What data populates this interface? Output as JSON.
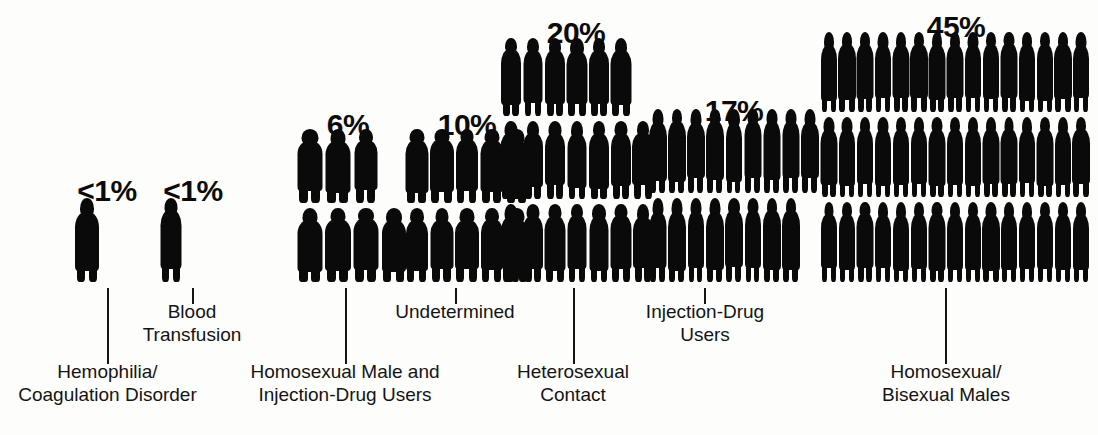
{
  "chart_data": {
    "type": "bar",
    "subtype": "pictogram-isotype",
    "title": "",
    "xlabel": "",
    "ylabel": "",
    "unit": "percent of cases",
    "categories": [
      "Hemophilia/Coagulation Disorder",
      "Blood Transfusion",
      "Homosexual Male and Injection-Drug Users",
      "Undetermined",
      "Heterosexual Contact",
      "Injection-Drug Users",
      "Homosexual/Bisexual Males"
    ],
    "values": [
      0.5,
      0.5,
      6,
      10,
      20,
      17,
      45
    ],
    "value_labels": [
      "<1%",
      "<1%",
      "6%",
      "10%",
      "20%",
      "17%",
      "45%"
    ],
    "icon_counts": [
      1,
      1,
      7,
      10,
      20,
      17,
      45
    ],
    "icon_glyph": "person-silhouette",
    "grid": false,
    "legend": false
  },
  "colors": {
    "background": "#fdfdfc",
    "ink": "#0a0a0a",
    "text": "#141414",
    "leader_line": "#151515"
  },
  "groups": [
    {
      "id": "hemophilia",
      "percent": "<1%",
      "label": "Hemophilia/\nCoagulation Disorder",
      "rows": [
        1
      ]
    },
    {
      "id": "blood-transfusion",
      "percent": "<1%",
      "label": "Blood\nTransfusion",
      "rows": [
        1
      ]
    },
    {
      "id": "homosexual-male-and-idu",
      "percent": "6%",
      "label": "Homosexual Male and\nInjection-Drug Users",
      "rows": [
        3,
        4
      ]
    },
    {
      "id": "undetermined",
      "percent": "10%",
      "label": "Undetermined",
      "rows": [
        5,
        5
      ]
    },
    {
      "id": "heterosexual-contact",
      "percent": "20%",
      "label": "Heterosexual\nContact",
      "rows": [
        6,
        7,
        7
      ]
    },
    {
      "id": "injection-drug-users",
      "percent": "17%",
      "label": "Injection-Drug\nUsers",
      "rows": [
        9,
        8
      ]
    },
    {
      "id": "homosexual-bisexual-males",
      "percent": "45%",
      "label": "Homosexual/\nBisexual Males",
      "rows": [
        15,
        15,
        15
      ]
    }
  ]
}
